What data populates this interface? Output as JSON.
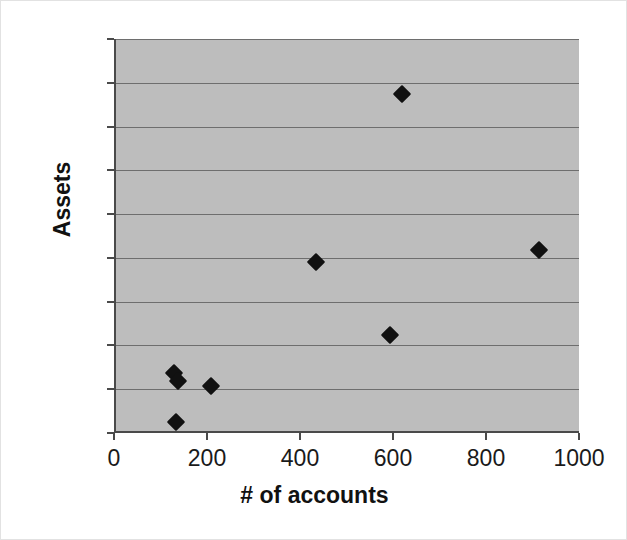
{
  "chart_data": {
    "type": "scatter",
    "title": "",
    "xlabel": "# of accounts",
    "ylabel": "Assets",
    "xlim": [
      0,
      1000
    ],
    "ylim": [
      0,
      45
    ],
    "xticks": [
      0,
      200,
      400,
      600,
      800,
      1000
    ],
    "yticks": [
      0,
      5,
      10,
      15,
      20,
      25,
      30,
      35,
      40,
      45
    ],
    "xtick_labels": [
      "0",
      "200",
      "400",
      "600",
      "800",
      "1000"
    ],
    "ytick_labels": [
      "0",
      "5",
      "10",
      "15",
      "20",
      "25",
      "30",
      "35",
      "40",
      "45"
    ],
    "grid": "horizontal",
    "legend": "none",
    "marker": "diamond",
    "marker_color": "#111111",
    "plot_background": "#bdbdbd",
    "gridline_color": "#6e6e6e",
    "axis_color": "#4a4a4a",
    "figure_background": "#ffffff",
    "points": [
      {
        "x": 125,
        "y": 6.8
      },
      {
        "x": 133,
        "y": 5.9
      },
      {
        "x": 130,
        "y": 1.3
      },
      {
        "x": 205,
        "y": 5.4
      },
      {
        "x": 430,
        "y": 19.5
      },
      {
        "x": 590,
        "y": 11.2
      },
      {
        "x": 615,
        "y": 38.7
      },
      {
        "x": 910,
        "y": 20.9
      }
    ]
  }
}
